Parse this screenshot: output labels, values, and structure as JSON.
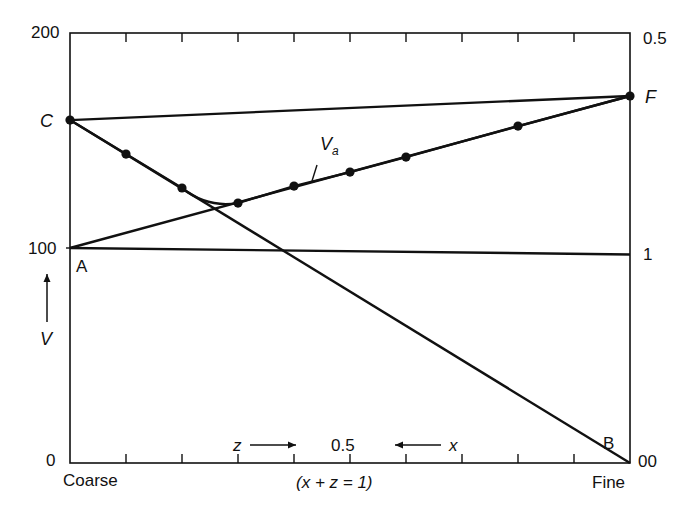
{
  "chart_data": {
    "type": "line",
    "title": "",
    "xlabel": "(x + z = 1)",
    "x_left_label": "Coarse",
    "x_right_label": "Fine",
    "x_mid_annotation": {
      "left_arrow_label": "z",
      "center_value": "0.5",
      "right_arrow_label": "x"
    },
    "ylabel": "V",
    "ylim": [
      0,
      200
    ],
    "left_axis_ticks": [
      "200",
      "100",
      "0"
    ],
    "right_axis_ticks": [
      "0.5",
      "1",
      "00"
    ],
    "x_ticks_count": 10,
    "x_range": [
      0,
      1
    ],
    "grid": false,
    "point_labels": {
      "C": "C",
      "F": "F",
      "A": "A",
      "B": "B",
      "Va": "V",
      "Va_sub": "a"
    },
    "series": [
      {
        "name": "C-F line",
        "points": [
          [
            0,
            159.5
          ],
          [
            1,
            170.7
          ]
        ]
      },
      {
        "name": "A horizontal line",
        "points": [
          [
            0,
            100
          ],
          [
            1,
            97
          ]
        ]
      },
      {
        "name": "A-F line (Va)",
        "points": [
          [
            0,
            100
          ],
          [
            1,
            170.7
          ]
        ]
      },
      {
        "name": "C-B line",
        "points": [
          [
            0,
            159.5
          ],
          [
            1,
            0
          ]
        ]
      },
      {
        "name": "Va curve (measured)",
        "points": [
          [
            0,
            159.5
          ],
          [
            0.1,
            143.7
          ],
          [
            0.2,
            127.9
          ],
          [
            0.3,
            120.9
          ],
          [
            0.4,
            128.8
          ],
          [
            0.5,
            135.3
          ],
          [
            0.6,
            142.3
          ],
          [
            0.8,
            156.7
          ],
          [
            1.0,
            170.7
          ]
        ]
      }
    ]
  }
}
